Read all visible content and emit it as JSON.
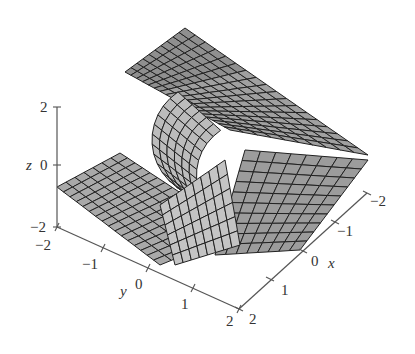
{
  "chart_data": {
    "type": "surface3d",
    "title": "",
    "xlabel": "x",
    "ylabel": "y",
    "zlabel": "z",
    "x_ticks": [
      "-2",
      "-1",
      "0",
      "1",
      "2"
    ],
    "y_ticks": [
      "-2",
      "-1",
      "0",
      "1",
      "2"
    ],
    "z_ticks": [
      "2",
      "0",
      "-2"
    ],
    "xlim": [
      -2,
      2
    ],
    "ylim": [
      -2,
      2
    ],
    "zlim": [
      -2,
      2
    ],
    "grid": false,
    "legend": null,
    "colors": {
      "surface": "#9a9a9a",
      "surface_light": "#c2c2c2",
      "mesh": "#222222",
      "axis": "#555555"
    }
  },
  "axes": {
    "z": {
      "label": "z",
      "ticks": [
        {
          "v": "2",
          "x": 57,
          "y": 107
        },
        {
          "v": "0",
          "x": 57,
          "y": 165
        },
        {
          "v": "-2",
          "x": 57,
          "y": 227
        }
      ]
    },
    "y": {
      "label": "y",
      "ticks": [
        {
          "v": "-2",
          "x": 57,
          "y": 227
        },
        {
          "v": "-1",
          "x": 103,
          "y": 248
        },
        {
          "v": "0",
          "x": 148,
          "y": 268
        },
        {
          "v": "1",
          "x": 193,
          "y": 288
        },
        {
          "v": "2",
          "x": 239,
          "y": 309
        }
      ]
    },
    "x": {
      "label": "x",
      "ticks": [
        {
          "v": "2",
          "x": 239,
          "y": 309
        },
        {
          "v": "1",
          "x": 270,
          "y": 279
        },
        {
          "v": "0",
          "x": 303,
          "y": 251
        },
        {
          "v": "-1",
          "x": 335,
          "y": 222
        },
        {
          "v": "-2",
          "x": 367,
          "y": 193
        }
      ]
    }
  }
}
